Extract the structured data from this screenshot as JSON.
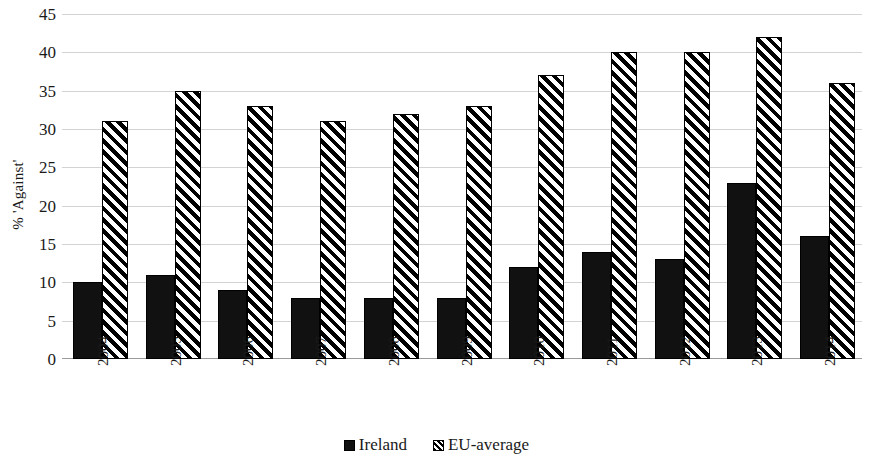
{
  "chart_data": {
    "type": "bar",
    "title": "",
    "xlabel": "",
    "ylabel": "% 'Against'",
    "categories": [
      "2004",
      "2005",
      "2006",
      "2007",
      "2008",
      "2009",
      "2010",
      "2011",
      "2012",
      "2013",
      "2014"
    ],
    "series": [
      {
        "name": "Ireland",
        "color": "#111111",
        "fill": "solid",
        "values": [
          10,
          11,
          9,
          8,
          8,
          8,
          12,
          14,
          13,
          23,
          16
        ]
      },
      {
        "name": "EU-average",
        "color": "#000000",
        "fill": "diagonal-hatch",
        "values": [
          31,
          35,
          33,
          31,
          32,
          33,
          37,
          40,
          40,
          42,
          36
        ]
      }
    ],
    "ylim": [
      0,
      45
    ],
    "ytick_step": 5,
    "yticks": [
      0,
      5,
      10,
      15,
      20,
      25,
      30,
      35,
      40,
      45
    ],
    "grid": true,
    "grid_axis": "y",
    "legend_position": "bottom-center",
    "xtick_rotation": -90
  },
  "legend": {
    "items": [
      {
        "label": "Ireland",
        "swatch": "solid-square-icon"
      },
      {
        "label": "EU-average",
        "swatch": "hatched-square-icon"
      }
    ]
  }
}
